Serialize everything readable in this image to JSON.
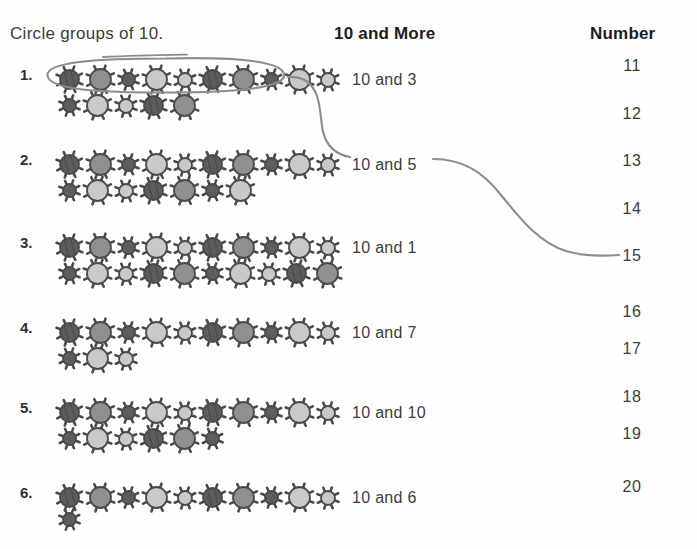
{
  "page": {
    "instruction": "Circle groups of 10.",
    "headers": {
      "more": "10 and More",
      "number": "Number"
    }
  },
  "rows": [
    {
      "label": "1.",
      "more": "10 and 3",
      "top_count": 10,
      "bottom_count": 5,
      "circled": true
    },
    {
      "label": "2.",
      "more": "10 and 5",
      "top_count": 10,
      "bottom_count": 7,
      "circled": false
    },
    {
      "label": "3.",
      "more": "10 and 1",
      "top_count": 10,
      "bottom_count": 10,
      "circled": false
    },
    {
      "label": "4.",
      "more": "10 and 7",
      "top_count": 10,
      "bottom_count": 3,
      "circled": false
    },
    {
      "label": "5.",
      "more": "10 and 10",
      "top_count": 10,
      "bottom_count": 6,
      "circled": false
    },
    {
      "label": "6.",
      "more": "10 and 6",
      "top_count": 10,
      "bottom_count": 1,
      "circled": false
    }
  ],
  "numbers": [
    "11",
    "12",
    "13",
    "14",
    "15",
    "16",
    "17",
    "18",
    "19",
    "20"
  ],
  "marks": {
    "oval_label": "circle-around-group-of-ten",
    "connector_1": "line-from-row-1-to-10-and-5",
    "connector_2": "line-from-10-and-5-to-15"
  },
  "colors": {
    "ink": "#3c3c3c",
    "pencil": "#8c8c8c",
    "bug_dark": "#5d5d5d",
    "bug_mid": "#8f8f8f",
    "bug_light": "#c9c9c9",
    "bug_outline": "#4a4a4a",
    "background": "#fefefe"
  }
}
